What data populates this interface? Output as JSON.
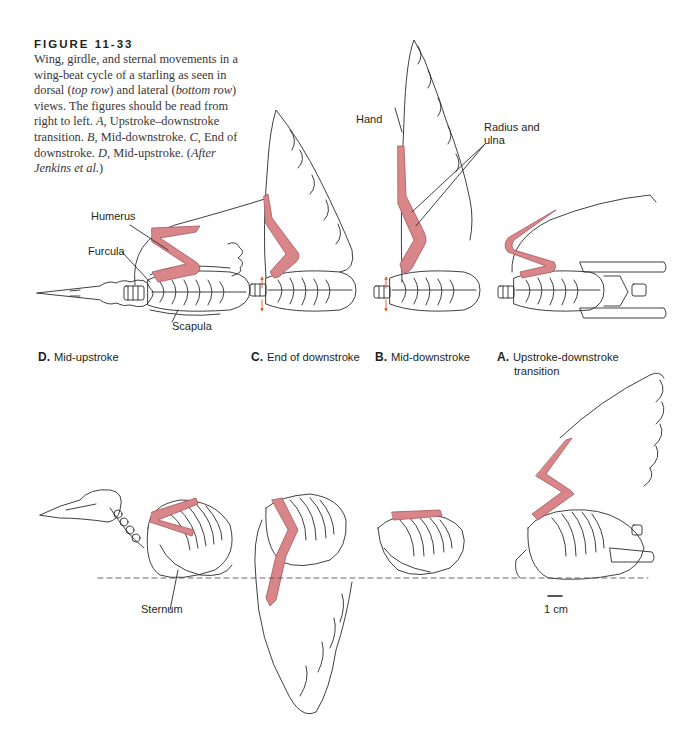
{
  "figure": {
    "number": "FIGURE 11-33",
    "caption_parts": [
      {
        "t": "Wing, girdle, and sternal movements in a wing-beat cycle of a starling as seen in dorsal (",
        "i": false
      },
      {
        "t": "top row",
        "i": true
      },
      {
        "t": ") and lateral (",
        "i": false
      },
      {
        "t": "bottom row",
        "i": true
      },
      {
        "t": ") views. The figures should be read from right to left. ",
        "i": false
      },
      {
        "t": "A,",
        "i": true
      },
      {
        "t": " Upstroke–downstroke transition. ",
        "i": false
      },
      {
        "t": "B,",
        "i": true
      },
      {
        "t": " Mid-downstroke. ",
        "i": false
      },
      {
        "t": "C,",
        "i": true
      },
      {
        "t": " End of downstroke. ",
        "i": false
      },
      {
        "t": "D,",
        "i": true
      },
      {
        "t": " Mid-upstroke. (",
        "i": false
      },
      {
        "t": "After Jenkins et al.",
        "i": true
      },
      {
        "t": ")",
        "i": false
      }
    ]
  },
  "labels": {
    "humerus": "Humerus",
    "furcula": "Furcula",
    "scapula": "Scapula",
    "hand": "Hand",
    "radius_ulna_line1": "Radius and",
    "radius_ulna_line2": "ulna",
    "sternum": "Sternum",
    "scale_bar": "1 cm"
  },
  "panels": [
    {
      "letter": "D.",
      "title": "Mid-upstroke"
    },
    {
      "letter": "C.",
      "title": "End of downstroke"
    },
    {
      "letter": "B.",
      "title": "Mid-downstroke"
    },
    {
      "letter": "A.",
      "title": "Upstroke-downstroke",
      "subtitle": "transition"
    }
  ],
  "colors": {
    "bone_highlight": "#d9868a",
    "bone_highlight_stroke": "#a8545a",
    "outline": "#2a2a2a",
    "arrow": "#d9532b",
    "text": "#231f20"
  }
}
